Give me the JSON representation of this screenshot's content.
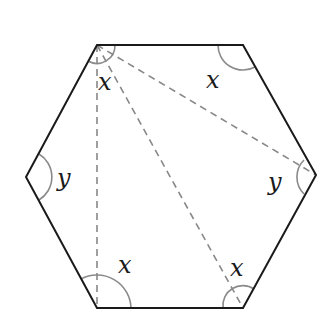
{
  "diagram": {
    "shape": "regular-hexagon",
    "colors": {
      "outline": "#1a1a1a",
      "dashed": "#888888",
      "arc": "#8a8a8a",
      "background": "#ffffff"
    },
    "vertices": {
      "top_left": [
        97,
        45
      ],
      "top_right": [
        243,
        45
      ],
      "right": [
        316,
        175
      ],
      "bottom_right": [
        243,
        308
      ],
      "bottom_left": [
        97,
        308
      ],
      "left": [
        26,
        177
      ]
    },
    "diagonals_from": "top_left",
    "diagonals_to": [
      "bottom_left",
      "bottom_right",
      "right"
    ],
    "labels": [
      {
        "text": "x",
        "at": "top_left_inner",
        "pos": [
          105,
          90
        ]
      },
      {
        "text": "x",
        "at": "top_right",
        "pos": [
          213,
          88
        ]
      },
      {
        "text": "y",
        "at": "left",
        "pos": [
          64,
          186
        ]
      },
      {
        "text": "y",
        "at": "right",
        "pos": [
          276,
          190
        ]
      },
      {
        "text": "x",
        "at": "bottom_left",
        "pos": [
          126,
          273
        ]
      },
      {
        "text": "x",
        "at": "bottom_right",
        "pos": [
          238,
          276
        ]
      }
    ]
  }
}
